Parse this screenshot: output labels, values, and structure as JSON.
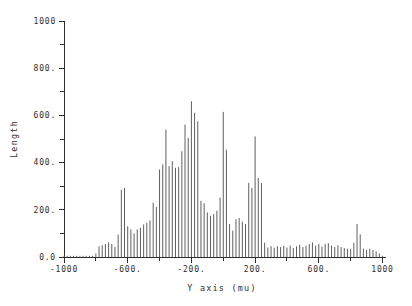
{
  "page": {
    "background": "#ffffff"
  },
  "chart_data": {
    "type": "bar",
    "subtype": "impulse-histogram",
    "title": "",
    "xlabel": "Y axis (mu)",
    "ylabel": "Length",
    "xlim": [
      -1000,
      1000
    ],
    "ylim": [
      0,
      1000
    ],
    "grid": false,
    "legend": "none",
    "bar_color": "#5f5f5f",
    "axis_color": "#2e2e2e",
    "xtick_labels": [
      "-1000",
      "-600.",
      "-200.",
      "200.",
      "600.",
      "1000"
    ],
    "xtick_values": [
      -1000,
      -600,
      -200,
      200,
      600,
      1000
    ],
    "xtick_minor": [
      -800,
      -400,
      0,
      400,
      800
    ],
    "ytick_labels": [
      "0.0",
      "200.",
      "400.",
      "600.",
      "800.",
      "1000"
    ],
    "ytick_values": [
      0,
      200,
      400,
      600,
      800,
      1000
    ],
    "ytick_minor": [
      100,
      300,
      500,
      700,
      900
    ],
    "x_start": -1000,
    "x_step": 20,
    "values": [
      0,
      0,
      0,
      0,
      0,
      0,
      0,
      0,
      0,
      5,
      15,
      45,
      50,
      55,
      62,
      55,
      42,
      95,
      285,
      292,
      130,
      117,
      100,
      117,
      124,
      138,
      145,
      155,
      230,
      212,
      371,
      392,
      540,
      385,
      406,
      378,
      381,
      448,
      561,
      505,
      660,
      611,
      575,
      238,
      228,
      189,
      175,
      182,
      196,
      252,
      615,
      455,
      140,
      112,
      160,
      165,
      150,
      140,
      314,
      293,
      511,
      335,
      314,
      61,
      40,
      46,
      40,
      46,
      42,
      48,
      40,
      48,
      38,
      45,
      52,
      42,
      48,
      55,
      62,
      48,
      55,
      44,
      55,
      58,
      48,
      42,
      50,
      42,
      38,
      35,
      35,
      60,
      140,
      96,
      35,
      30,
      35,
      30,
      24,
      15,
      0
    ]
  }
}
